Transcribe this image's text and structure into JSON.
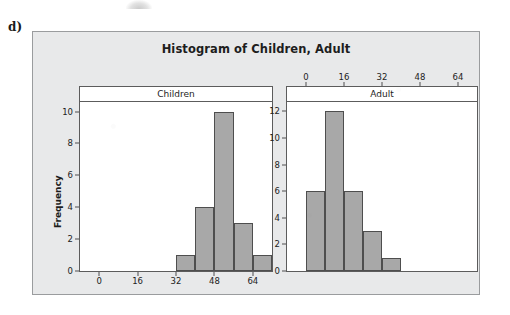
{
  "part_label": "d)",
  "figure": {
    "title": "Histogram of Children, Adult"
  },
  "chart_data": [
    {
      "type": "bar",
      "title": "Histogram of Children, Adult",
      "panel": "Children",
      "xlabel": "",
      "ylabel": "Frequency",
      "bin_width": 8,
      "bin_starts": [
        32,
        40,
        48,
        56,
        64
      ],
      "categories": [
        "32-40",
        "40-48",
        "48-56",
        "56-64",
        "64-72"
      ],
      "values": [
        1,
        4,
        10,
        3,
        1
      ],
      "xlim": [
        -8,
        72
      ],
      "ylim": [
        0,
        10.6
      ],
      "xticks": [
        0,
        16,
        32,
        48,
        64
      ],
      "yticks": [
        0,
        2,
        4,
        6,
        8,
        10
      ],
      "xtick_labels": [
        "0",
        "16",
        "32",
        "48",
        "64"
      ],
      "ytick_labels": [
        "0",
        "2",
        "4",
        "6",
        "8",
        "10"
      ],
      "xaxis_position": "bottom",
      "grid": false,
      "legend": "none",
      "bar_fill": "#a8a8a8",
      "bar_edge": "#4e4e4e"
    },
    {
      "type": "bar",
      "title": "Histogram of Children, Adult",
      "panel": "Adult",
      "xlabel": "",
      "ylabel": "Frequency",
      "bin_width": 8,
      "bin_starts": [
        0,
        8,
        16,
        24,
        32
      ],
      "categories": [
        "0-8",
        "8-16",
        "16-24",
        "24-32",
        "32-40"
      ],
      "values": [
        6,
        12,
        6,
        3,
        1
      ],
      "xlim": [
        -8,
        72
      ],
      "ylim": [
        0,
        12.7
      ],
      "xticks": [
        0,
        16,
        32,
        48,
        64
      ],
      "yticks": [
        0,
        2,
        4,
        6,
        8,
        10,
        12
      ],
      "xtick_labels": [
        "0",
        "16",
        "32",
        "48",
        "64"
      ],
      "ytick_labels": [
        "0",
        "2",
        "4",
        "6",
        "8",
        "10",
        "12"
      ],
      "xaxis_position": "top",
      "grid": false,
      "legend": "none",
      "bar_fill": "#a8a8a8",
      "bar_edge": "#4e4e4e"
    }
  ],
  "colors": {
    "figure_background": "#e8e9ea",
    "panel_background": "#ffffff",
    "frame": "#9a9c9e",
    "axis": "#5c5c5c",
    "bar_fill": "#a8a8a8",
    "bar_edge": "#4e4e4e",
    "text": "#1d1d1d"
  }
}
